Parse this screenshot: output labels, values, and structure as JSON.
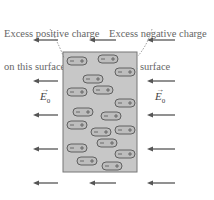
{
  "labels": {
    "left_line1": "Excess positive charge",
    "left_line2": "on this surface",
    "right_line1": "Excess negative charge",
    "right_line2": "on this surface",
    "field_symbol": "E",
    "field_subscript": "0",
    "vector_arrow": "→"
  },
  "slab": {
    "x": 63,
    "y": 52,
    "width": 74,
    "height": 120,
    "fill": "#c7c7c7",
    "stroke": "#777777"
  },
  "field_arrows": {
    "direction": "left",
    "color": "#555555",
    "rows_y": [
      40,
      81,
      115,
      149,
      183
    ],
    "columns": [
      [
        33,
        58
      ],
      [
        89,
        116
      ],
      [
        147,
        175
      ]
    ]
  },
  "dipoles": [
    {
      "x": 67,
      "y": 57
    },
    {
      "x": 98,
      "y": 55
    },
    {
      "x": 115,
      "y": 68
    },
    {
      "x": 83,
      "y": 75
    },
    {
      "x": 67,
      "y": 88
    },
    {
      "x": 93,
      "y": 86
    },
    {
      "x": 115,
      "y": 99
    },
    {
      "x": 73,
      "y": 108
    },
    {
      "x": 101,
      "y": 112
    },
    {
      "x": 67,
      "y": 121
    },
    {
      "x": 91,
      "y": 128
    },
    {
      "x": 115,
      "y": 126
    },
    {
      "x": 97,
      "y": 139
    },
    {
      "x": 67,
      "y": 144
    },
    {
      "x": 115,
      "y": 150
    },
    {
      "x": 77,
      "y": 157
    },
    {
      "x": 102,
      "y": 162
    }
  ],
  "dipole_style": {
    "width": 20,
    "height": 8,
    "fill": "#bdbdbd",
    "stroke": "#555555",
    "plus": "+",
    "minus": "−"
  }
}
